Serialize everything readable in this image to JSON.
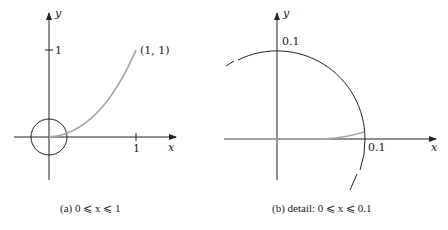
{
  "figure": {
    "panel_a": {
      "x_axis_label": "x",
      "y_axis_label": "y",
      "x_tick": "1",
      "y_tick": "1",
      "point_label": "(1, 1)",
      "caption": "(a)  0 ⩽ x ⩽ 1"
    },
    "panel_b": {
      "x_axis_label": "x",
      "y_axis_label": "y",
      "x_tick": "0.1",
      "y_tick": "0.1",
      "caption": "(b)   detail:  0 ⩽ x ⩽ 0.1"
    },
    "colors": {
      "axis": "#222222",
      "curve": "#a8a8a8"
    }
  }
}
